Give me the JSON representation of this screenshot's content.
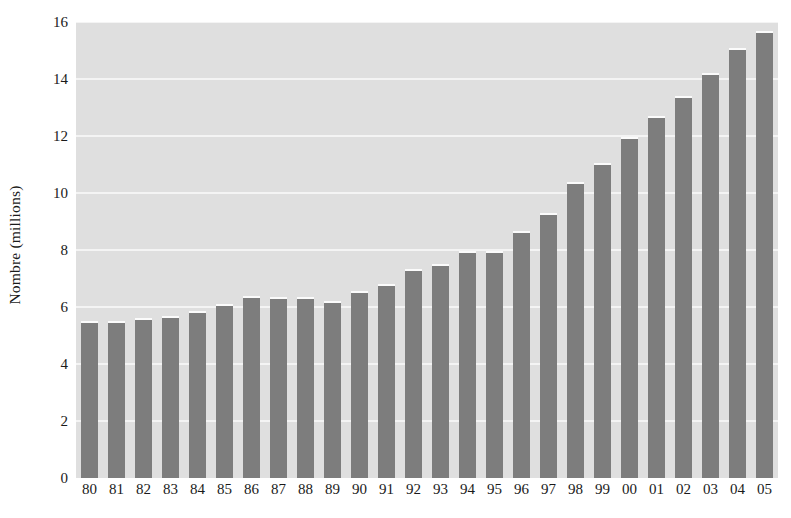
{
  "chart_data": {
    "type": "bar",
    "title": "",
    "subtitle": "",
    "xlabel": "",
    "ylabel": "Nombre (millions)",
    "categories": [
      "80",
      "81",
      "82",
      "83",
      "84",
      "85",
      "86",
      "87",
      "88",
      "89",
      "90",
      "91",
      "92",
      "93",
      "94",
      "95",
      "96",
      "97",
      "98",
      "99",
      "00",
      "01",
      "02",
      "03",
      "04",
      "05"
    ],
    "values": [
      5.5,
      5.5,
      5.6,
      5.7,
      5.85,
      6.1,
      6.4,
      6.35,
      6.35,
      6.2,
      6.55,
      6.8,
      7.35,
      7.5,
      7.95,
      7.95,
      8.65,
      9.3,
      10.4,
      11.05,
      11.95,
      12.7,
      13.4,
      14.2,
      15.1,
      15.7
    ],
    "ylim": [
      0,
      16
    ],
    "xlim": null,
    "yticks": [
      0,
      2,
      4,
      6,
      8,
      10,
      12,
      14,
      16
    ],
    "ytick_labels": [
      "0",
      "2",
      "4",
      "6",
      "8",
      "10",
      "12",
      "14",
      "16"
    ],
    "grid": true,
    "grid_axis": "y",
    "legend": null,
    "legend_position": "none",
    "annotations": [],
    "colors": {
      "bar_fill": "#7d7d7d",
      "bar_top_highlight": "#fbfbfb",
      "plot_background": "#dfdfdf",
      "gridline": "#f4f4f4",
      "page_background": "#ffffff",
      "text": "#1a1a1a"
    }
  }
}
